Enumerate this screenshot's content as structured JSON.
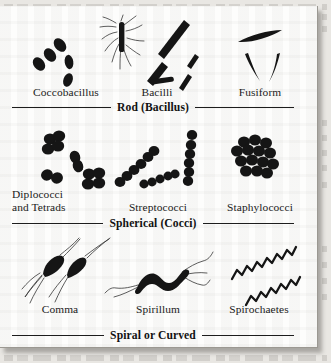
{
  "figure": {
    "title_visible": false,
    "background_color": "#e9e7e3",
    "card_color": "#fdfdfc",
    "ink_color": "#151515",
    "groups": [
      {
        "group_label": "Rod (Bacillus)",
        "specimens": [
          {
            "name": "Coccobacillus",
            "label": "Coccobacillus",
            "shape": "short-ovoid-rods"
          },
          {
            "name": "Bacilli",
            "label": "Bacilli",
            "shape": "straight-rods-with-flagella"
          },
          {
            "name": "Fusiform",
            "label": "Fusiform",
            "shape": "tapered-spindle-rods"
          }
        ]
      },
      {
        "group_label": "Spherical (Cocci)",
        "specimens": [
          {
            "name": "Diplococci and Tetrads",
            "label": "Diplococci\nand Tetrads",
            "shape": "pairs-and-tetrads"
          },
          {
            "name": "Streptococci",
            "label": "Streptococci",
            "shape": "chains-of-cocci"
          },
          {
            "name": "Staphylococci",
            "label": "Staphylococci",
            "shape": "grape-like-cluster"
          }
        ]
      },
      {
        "group_label": "Spiral or Curved",
        "specimens": [
          {
            "name": "Comma",
            "label": "Comma",
            "shape": "curved-vibrio-with-flagella"
          },
          {
            "name": "Spirillum",
            "label": "Spirillum",
            "shape": "rigid-wavy-cell-with-polar-flagella"
          },
          {
            "name": "Spirochaetes",
            "label": "Spirochaetes",
            "shape": "tight-helical-coils"
          }
        ]
      }
    ]
  }
}
